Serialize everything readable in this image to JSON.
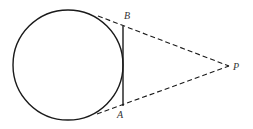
{
  "diagram": {
    "circle": {
      "cx": 68,
      "cy": 65,
      "r": 55
    },
    "points": {
      "B": {
        "label": "B",
        "x": 123,
        "y": 26
      },
      "A": {
        "label": "A",
        "x": 123,
        "y": 106
      },
      "P": {
        "label": "P",
        "x": 229,
        "y": 66
      }
    },
    "labels": {
      "B": "B",
      "A": "A",
      "P": "P"
    },
    "colors": {
      "stroke": "#1a1a1a",
      "label": "#333333"
    }
  }
}
